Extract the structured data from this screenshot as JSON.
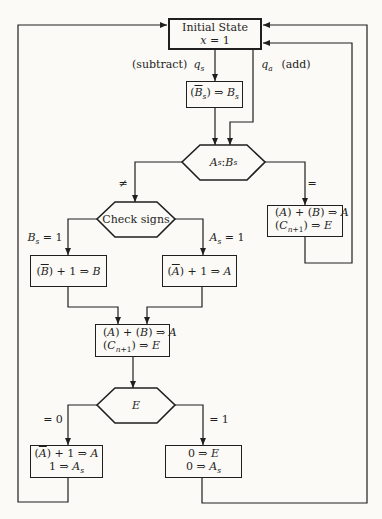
{
  "colors": {
    "ink": "#1f1f1f",
    "paper": "#fbfaf6"
  },
  "nodes": {
    "initial_state": {
      "lines": [
        [
          {
            "t": "Initial State",
            "s": ""
          }
        ],
        [
          {
            "t": "x",
            "s": "i"
          },
          {
            "t": " = 1",
            "s": ""
          }
        ]
      ]
    },
    "complement_bs": {
      "lines": [
        [
          {
            "t": "(",
            "s": ""
          },
          {
            "t": "B",
            "s": "i over"
          },
          {
            "t": "s",
            "s": "i sub"
          },
          {
            "t": ") ⇒ ",
            "s": ""
          },
          {
            "t": "B",
            "s": "i"
          },
          {
            "t": "s",
            "s": "i sub"
          }
        ]
      ]
    },
    "compare_signs": {
      "lines": [
        [
          {
            "t": "A",
            "s": "i"
          },
          {
            "t": "s",
            "s": "i sub"
          },
          {
            "t": " : ",
            "s": ""
          },
          {
            "t": "B",
            "s": "i"
          },
          {
            "t": "s",
            "s": "i sub"
          }
        ]
      ]
    },
    "add_right": {
      "lines": [
        [
          {
            "t": "(",
            "s": ""
          },
          {
            "t": "A",
            "s": "i"
          },
          {
            "t": ") + (",
            "s": ""
          },
          {
            "t": "B",
            "s": "i"
          },
          {
            "t": ") ⇒ ",
            "s": ""
          },
          {
            "t": "A",
            "s": "i"
          }
        ],
        [
          {
            "t": "(",
            "s": ""
          },
          {
            "t": "C",
            "s": "i"
          },
          {
            "t": "n",
            "s": "i sub"
          },
          {
            "t": "+1",
            "s": "sub"
          },
          {
            "t": ") ⇒ ",
            "s": ""
          },
          {
            "t": "E",
            "s": "i"
          }
        ]
      ]
    },
    "check_signs": {
      "lines": [
        [
          {
            "t": "Check signs",
            "s": ""
          }
        ]
      ]
    },
    "complement_b": {
      "lines": [
        [
          {
            "t": "(",
            "s": ""
          },
          {
            "t": "B",
            "s": "i over"
          },
          {
            "t": ") + 1 ⇒ ",
            "s": ""
          },
          {
            "t": "B",
            "s": "i"
          }
        ]
      ]
    },
    "complement_a": {
      "lines": [
        [
          {
            "t": "(",
            "s": ""
          },
          {
            "t": "A",
            "s": "i over"
          },
          {
            "t": ") + 1 ⇒ ",
            "s": ""
          },
          {
            "t": "A",
            "s": "i"
          }
        ]
      ]
    },
    "add_center": {
      "lines": [
        [
          {
            "t": "(",
            "s": ""
          },
          {
            "t": "A",
            "s": "i"
          },
          {
            "t": ") + (",
            "s": ""
          },
          {
            "t": "B",
            "s": "i"
          },
          {
            "t": ") ⇒ ",
            "s": ""
          },
          {
            "t": "A",
            "s": "i"
          }
        ],
        [
          {
            "t": "(",
            "s": ""
          },
          {
            "t": "C",
            "s": "i"
          },
          {
            "t": "n",
            "s": "i sub"
          },
          {
            "t": "+1",
            "s": "sub"
          },
          {
            "t": ") ⇒ ",
            "s": ""
          },
          {
            "t": "E",
            "s": "i"
          }
        ]
      ]
    },
    "test_e": {
      "lines": [
        [
          {
            "t": "E",
            "s": "i"
          }
        ]
      ]
    },
    "correct_sign": {
      "lines": [
        [
          {
            "t": "(",
            "s": ""
          },
          {
            "t": "A",
            "s": "i over"
          },
          {
            "t": ") + 1 ⇒ ",
            "s": ""
          },
          {
            "t": "A",
            "s": "i"
          }
        ],
        [
          {
            "t": "1 ⇒ ",
            "s": ""
          },
          {
            "t": "A",
            "s": "i"
          },
          {
            "t": "s",
            "s": "i sub"
          }
        ]
      ]
    },
    "clear_e_as": {
      "lines": [
        [
          {
            "t": "0 ⇒ ",
            "s": ""
          },
          {
            "t": "E",
            "s": "i"
          }
        ],
        [
          {
            "t": "0 ⇒ ",
            "s": ""
          },
          {
            "t": "A",
            "s": "i"
          },
          {
            "t": "s",
            "s": "i sub"
          }
        ]
      ]
    }
  },
  "edge_labels": {
    "subtract": [
      {
        "t": "(subtract)",
        "s": ""
      }
    ],
    "qs": [
      {
        "t": "q",
        "s": "i"
      },
      {
        "t": "s",
        "s": "i sub"
      }
    ],
    "qa": [
      {
        "t": "q",
        "s": "i"
      },
      {
        "t": "a",
        "s": "i sub"
      }
    ],
    "add": [
      {
        "t": "(add)",
        "s": ""
      }
    ],
    "neq": [
      {
        "t": "≠",
        "s": ""
      }
    ],
    "eq": [
      {
        "t": "=",
        "s": ""
      }
    ],
    "bs_eq_1": [
      {
        "t": "B",
        "s": "i"
      },
      {
        "t": "s",
        "s": "i sub"
      },
      {
        "t": " = 1",
        "s": ""
      }
    ],
    "as_eq_1": [
      {
        "t": "A",
        "s": "i"
      },
      {
        "t": "s",
        "s": "i sub"
      },
      {
        "t": " = 1",
        "s": ""
      }
    ],
    "e_eq_0": [
      {
        "t": "= 0",
        "s": ""
      }
    ],
    "e_eq_1": [
      {
        "t": "= 1",
        "s": ""
      }
    ]
  }
}
